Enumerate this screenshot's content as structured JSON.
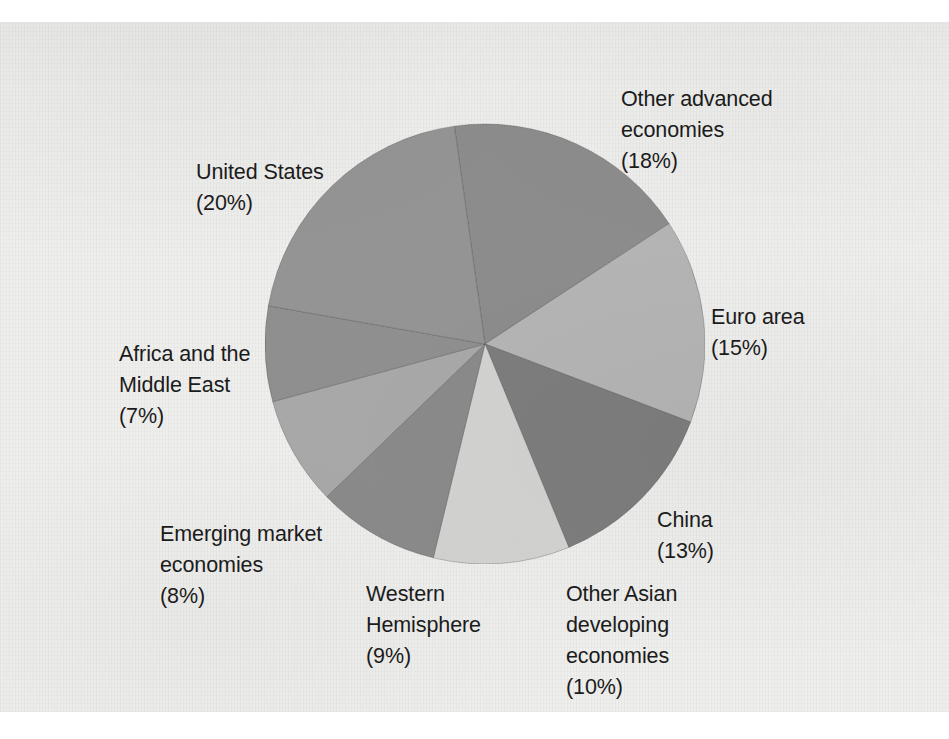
{
  "figure": {
    "background_color": "#eeeeec",
    "text_color": "#1b1b1b"
  },
  "labels": {
    "other_advanced": "Other advanced\neconomies\n(18%)",
    "euro_area": "Euro area\n(15%)",
    "china": "China\n(13%)",
    "other_asian": "Other Asian\ndeveloping\neconomies\n(10%)",
    "western_hemisphere": "Western\nHemisphere\n(9%)",
    "emerging_market": "Emerging market\neconomies\n(8%)",
    "africa_middle_east": "Africa and the\nMiddle East\n(7%)",
    "united_states": "United States\n(20%)"
  },
  "chart_data": {
    "type": "pie",
    "title": "",
    "subtitle": "",
    "xlabel": "",
    "ylabel": "",
    "grid": false,
    "legend_position": "outside-labels",
    "value_unit": "percent",
    "start_angle_deg": -8,
    "direction": "clockwise",
    "total": 100,
    "center_px": [
      485,
      342
    ],
    "radius_px": 220,
    "categories": [
      "Other advanced economies",
      "Euro area",
      "China",
      "Other Asian developing economies",
      "Western Hemisphere",
      "Emerging market economies",
      "Africa and the Middle East",
      "United States"
    ],
    "values": [
      18,
      15,
      13,
      10,
      9,
      8,
      7,
      20
    ],
    "slices": [
      {
        "label": "Other advanced economies",
        "value": 18,
        "value_text": "(18%)",
        "color": "#8c8c8c"
      },
      {
        "label": "Euro area",
        "value": 15,
        "value_text": "(15%)",
        "color": "#b4b4b4"
      },
      {
        "label": "China",
        "value": 13,
        "value_text": "(13%)",
        "color": "#7d7d7d"
      },
      {
        "label": "Other Asian developing economies",
        "value": 10,
        "value_text": "(10%)",
        "color": "#d2d2d0"
      },
      {
        "label": "Western Hemisphere",
        "value": 9,
        "value_text": "(9%)",
        "color": "#8a8a8a"
      },
      {
        "label": "Emerging market economies",
        "value": 8,
        "value_text": "(8%)",
        "color": "#a8a8a8"
      },
      {
        "label": "Africa and the Middle East",
        "value": 7,
        "value_text": "(7%)",
        "color": "#8f8f8f"
      },
      {
        "label": "United States",
        "value": 20,
        "value_text": "(20%)",
        "color": "#949494"
      }
    ]
  }
}
